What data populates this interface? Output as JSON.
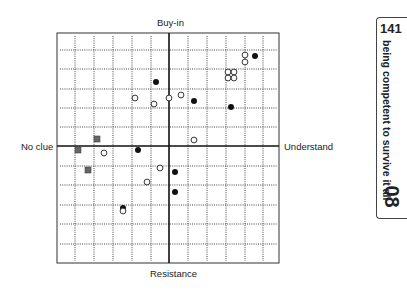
{
  "diagram": {
    "axis_labels": {
      "top": "Buy-in",
      "bottom": "Resistance",
      "left": "No clue",
      "right": "Understand"
    },
    "frame": {
      "left": 57,
      "top": 33,
      "right": 279,
      "bottom": 263
    },
    "axes_center": {
      "x": 169,
      "y": 146
    },
    "grid": {
      "vertical_dotted_x": [
        75,
        94,
        113,
        132,
        151,
        188,
        207,
        226,
        245,
        263
      ],
      "horizontal_dotted_y": [
        50,
        69,
        89,
        108,
        127,
        166,
        185,
        205,
        224,
        244
      ]
    },
    "legend_markers": {
      "filled_circle": "#111111",
      "open_circle": "#ffffff",
      "square": "#666666"
    },
    "points": [
      {
        "type": "filled",
        "x": 255,
        "y": 56
      },
      {
        "type": "filled",
        "x": 156,
        "y": 82
      },
      {
        "type": "filled",
        "x": 194,
        "y": 101
      },
      {
        "type": "filled",
        "x": 231,
        "y": 107
      },
      {
        "type": "filled",
        "x": 138,
        "y": 150
      },
      {
        "type": "filled",
        "x": 175,
        "y": 172
      },
      {
        "type": "filled",
        "x": 175,
        "y": 192
      },
      {
        "type": "filled",
        "x": 123,
        "y": 208
      },
      {
        "type": "open",
        "x": 245,
        "y": 55
      },
      {
        "type": "open",
        "x": 245,
        "y": 62
      },
      {
        "type": "open",
        "x": 228,
        "y": 72
      },
      {
        "type": "open",
        "x": 234,
        "y": 72
      },
      {
        "type": "open",
        "x": 228,
        "y": 78
      },
      {
        "type": "open",
        "x": 234,
        "y": 78
      },
      {
        "type": "open",
        "x": 135,
        "y": 98
      },
      {
        "type": "open",
        "x": 154,
        "y": 104
      },
      {
        "type": "open",
        "x": 169,
        "y": 98
      },
      {
        "type": "open",
        "x": 181,
        "y": 95
      },
      {
        "type": "open",
        "x": 194,
        "y": 140
      },
      {
        "type": "open",
        "x": 104,
        "y": 153
      },
      {
        "type": "open",
        "x": 160,
        "y": 168
      },
      {
        "type": "open",
        "x": 147,
        "y": 182
      },
      {
        "type": "open",
        "x": 123,
        "y": 211
      },
      {
        "type": "square",
        "x": 97,
        "y": 139
      },
      {
        "type": "square",
        "x": 78,
        "y": 150
      },
      {
        "type": "square",
        "x": 88,
        "y": 170
      }
    ]
  },
  "side_tab": {
    "page_number": "141",
    "title": "being competent to survive it all",
    "chapter": "08"
  }
}
